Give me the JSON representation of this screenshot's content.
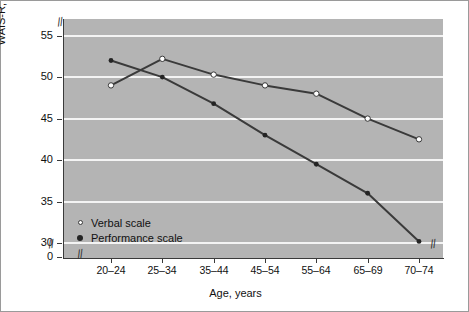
{
  "chart_data": {
    "type": "line",
    "title": "",
    "xlabel": "Age, years",
    "ylabel": "WAIS-R, scaled scores",
    "categories": [
      "20–24",
      "25–34",
      "35–44",
      "45–54",
      "55–64",
      "65–69",
      "70–74"
    ],
    "series": [
      {
        "name": "Verbal scale",
        "marker": "open-circle",
        "values": [
          49.0,
          52.2,
          50.3,
          49.0,
          48.0,
          45.0,
          42.5
        ]
      },
      {
        "name": "Performance scale",
        "marker": "filled-circle",
        "values": [
          52.0,
          50.0,
          46.8,
          43.0,
          39.5,
          36.0,
          30.2
        ]
      }
    ],
    "yticks": [
      0,
      30,
      35,
      40,
      45,
      50,
      55
    ],
    "ytick_labels": [
      "0",
      "30",
      "35",
      "40",
      "45",
      "50",
      "55"
    ],
    "ylim": [
      28.2,
      57.0
    ],
    "grid": true,
    "grid_values": [
      30,
      35,
      40,
      45,
      50,
      55
    ],
    "axis_breaks": [
      "y-axis-top",
      "y-axis-bottom",
      "x-axis-left",
      "x-axis-right"
    ],
    "break_glyph": "//",
    "legend_position": "inside-bottom-left",
    "plot_background": "#b4b4b4",
    "gridline_color": "#f4f4f4",
    "line_color": "#3a3a3a",
    "axis_color": "#3a3a3a",
    "frame_color": "#9a9a9a"
  },
  "legend": {
    "items": [
      {
        "label": "Verbal scale",
        "marker": "open-circle"
      },
      {
        "label": "Performance scale",
        "marker": "filled-circle"
      }
    ]
  }
}
